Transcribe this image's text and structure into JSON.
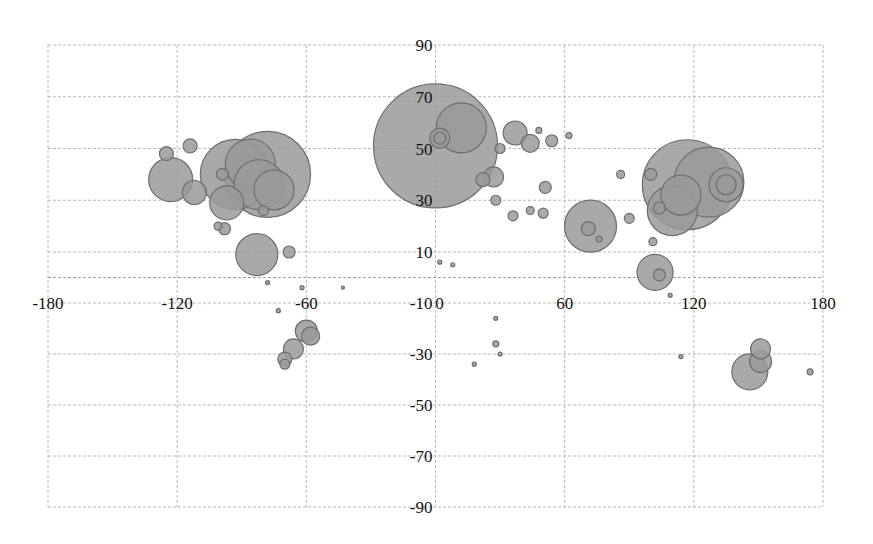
{
  "chart_data": {
    "type": "scatter",
    "subtype": "bubble",
    "title": "",
    "xlabel": "",
    "ylabel": "",
    "xlim": [
      -180,
      180
    ],
    "ylim": [
      -90,
      90
    ],
    "x_ticks": [
      -180,
      -120,
      -60,
      0,
      60,
      120,
      180
    ],
    "y_ticks": [
      90,
      70,
      50,
      30,
      10,
      -10,
      -30,
      -50,
      -70,
      -90
    ],
    "grid": true,
    "legend": null,
    "colors": {
      "bubble_fill": "#9a9a9a",
      "bubble_stroke": "#6e6e6e",
      "grid": "#b8b8b8"
    },
    "series": [
      {
        "name": "locations",
        "points": [
          {
            "x": 0,
            "y": 51,
            "r": 62
          },
          {
            "x": 12,
            "y": 58,
            "r": 25
          },
          {
            "x": 2,
            "y": 54,
            "r": 10
          },
          {
            "x": 2,
            "y": 54,
            "r": 6
          },
          {
            "x": -78,
            "y": 40,
            "r": 43
          },
          {
            "x": -93,
            "y": 40,
            "r": 35
          },
          {
            "x": -86,
            "y": 44,
            "r": 25
          },
          {
            "x": -82,
            "y": 36,
            "r": 25
          },
          {
            "x": -75,
            "y": 34,
            "r": 20
          },
          {
            "x": -123,
            "y": 38,
            "r": 22
          },
          {
            "x": -112,
            "y": 33,
            "r": 12
          },
          {
            "x": -97,
            "y": 29,
            "r": 17
          },
          {
            "x": -99,
            "y": 40,
            "r": 6
          },
          {
            "x": -125,
            "y": 48,
            "r": 7
          },
          {
            "x": -114,
            "y": 51,
            "r": 7
          },
          {
            "x": -80,
            "y": 26,
            "r": 5
          },
          {
            "x": -98,
            "y": 19,
            "r": 6
          },
          {
            "x": -101,
            "y": 20,
            "r": 4
          },
          {
            "x": -83,
            "y": 9,
            "r": 21
          },
          {
            "x": -68,
            "y": 10,
            "r": 6
          },
          {
            "x": -58,
            "y": -23,
            "r": 9
          },
          {
            "x": -60,
            "y": -21,
            "r": 11
          },
          {
            "x": -66,
            "y": -28,
            "r": 10
          },
          {
            "x": -70,
            "y": -32,
            "r": 7
          },
          {
            "x": -70,
            "y": -34,
            "r": 5
          },
          {
            "x": 117,
            "y": 36,
            "r": 45
          },
          {
            "x": 127,
            "y": 37,
            "r": 35
          },
          {
            "x": 110,
            "y": 26,
            "r": 25
          },
          {
            "x": 114,
            "y": 32,
            "r": 20
          },
          {
            "x": 135,
            "y": 36,
            "r": 17
          },
          {
            "x": 135,
            "y": 36,
            "r": 10
          },
          {
            "x": 72,
            "y": 20,
            "r": 26
          },
          {
            "x": 71,
            "y": 19,
            "r": 7
          },
          {
            "x": 102,
            "y": 2,
            "r": 18
          },
          {
            "x": 104,
            "y": 1,
            "r": 6
          },
          {
            "x": 101,
            "y": 14,
            "r": 4
          },
          {
            "x": 104,
            "y": 27,
            "r": 6
          },
          {
            "x": 100,
            "y": 40,
            "r": 6
          },
          {
            "x": 37,
            "y": 56,
            "r": 12
          },
          {
            "x": 44,
            "y": 52,
            "r": 9
          },
          {
            "x": 30,
            "y": 50,
            "r": 5
          },
          {
            "x": 54,
            "y": 53,
            "r": 6
          },
          {
            "x": 27,
            "y": 39,
            "r": 10
          },
          {
            "x": 22,
            "y": 38,
            "r": 7
          },
          {
            "x": 28,
            "y": 30,
            "r": 5
          },
          {
            "x": 36,
            "y": 24,
            "r": 5
          },
          {
            "x": 51,
            "y": 35,
            "r": 6
          },
          {
            "x": 50,
            "y": 25,
            "r": 5
          },
          {
            "x": 44,
            "y": 26,
            "r": 4
          },
          {
            "x": 86,
            "y": 40,
            "r": 4
          },
          {
            "x": 48,
            "y": 57,
            "r": 3
          },
          {
            "x": 62,
            "y": 55,
            "r": 3
          },
          {
            "x": 90,
            "y": 23,
            "r": 5
          },
          {
            "x": 76,
            "y": 15,
            "r": 3
          },
          {
            "x": 2,
            "y": 6,
            "r": 2
          },
          {
            "x": 8,
            "y": 5,
            "r": 2
          },
          {
            "x": 18,
            "y": -34,
            "r": 2
          },
          {
            "x": 28,
            "y": -26,
            "r": 3
          },
          {
            "x": 30,
            "y": -30,
            "r": 2
          },
          {
            "x": 28,
            "y": -16,
            "r": 2
          },
          {
            "x": 114,
            "y": -31,
            "r": 2
          },
          {
            "x": 109,
            "y": -7,
            "r": 2
          },
          {
            "x": 146,
            "y": -37,
            "r": 18
          },
          {
            "x": 151,
            "y": -33,
            "r": 11
          },
          {
            "x": 151,
            "y": -28,
            "r": 10
          },
          {
            "x": 174,
            "y": -37,
            "r": 3
          },
          {
            "x": -73,
            "y": -13,
            "r": 2
          },
          {
            "x": -62,
            "y": -4,
            "r": 2
          },
          {
            "x": -43,
            "y": -4,
            "r": 1.5
          },
          {
            "x": -78,
            "y": -2,
            "r": 2
          }
        ]
      }
    ]
  },
  "axes": {
    "x_labels": [
      "-180",
      "-120",
      "-60",
      "0",
      "60",
      "120",
      "180"
    ],
    "y_labels": [
      "90",
      "70",
      "50",
      "30",
      "10",
      "-10",
      "-30",
      "-50",
      "-70",
      "-90"
    ]
  }
}
